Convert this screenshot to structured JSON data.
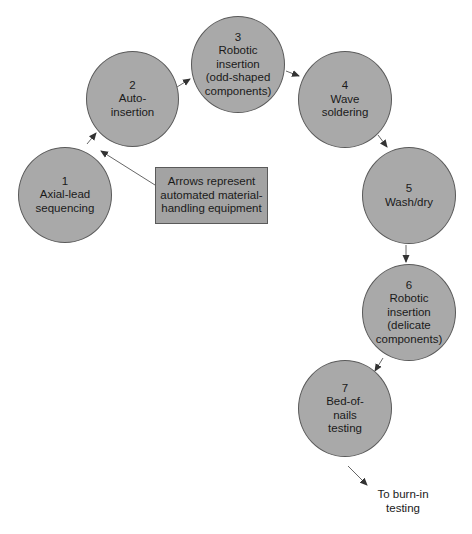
{
  "diagram": {
    "type": "process-flow",
    "colors": {
      "node_fill": "#a9a9a9",
      "node_stroke": "#5a5a5a",
      "arrow": "#444444",
      "background": "#ffffff"
    },
    "nodes": [
      {
        "id": 1,
        "number": "1",
        "lines": [
          "Axial-lead",
          "sequencing"
        ]
      },
      {
        "id": 2,
        "number": "2",
        "lines": [
          "Auto-",
          "insertion"
        ]
      },
      {
        "id": 3,
        "number": "3",
        "lines": [
          "Robotic",
          "insertion",
          "(odd-shaped",
          "components)"
        ]
      },
      {
        "id": 4,
        "number": "4",
        "lines": [
          "Wave",
          "soldering"
        ]
      },
      {
        "id": 5,
        "number": "5",
        "lines": [
          "Wash/dry"
        ]
      },
      {
        "id": 6,
        "number": "6",
        "lines": [
          "Robotic",
          "insertion",
          "(delicate",
          "components)"
        ]
      },
      {
        "id": 7,
        "number": "7",
        "lines": [
          "Bed-of-",
          "nails",
          "testing"
        ]
      }
    ],
    "edges": [
      {
        "from": 1,
        "to": 2
      },
      {
        "from": 2,
        "to": 3
      },
      {
        "from": 3,
        "to": 4
      },
      {
        "from": 4,
        "to": 5
      },
      {
        "from": 5,
        "to": 6
      },
      {
        "from": 6,
        "to": 7
      },
      {
        "from": 7,
        "to": "exit"
      }
    ],
    "legend": {
      "lines": [
        "Arrows represent",
        "automated material-",
        "handling equipment"
      ]
    },
    "exit": {
      "lines": [
        "To burn-in",
        "testing"
      ]
    }
  }
}
